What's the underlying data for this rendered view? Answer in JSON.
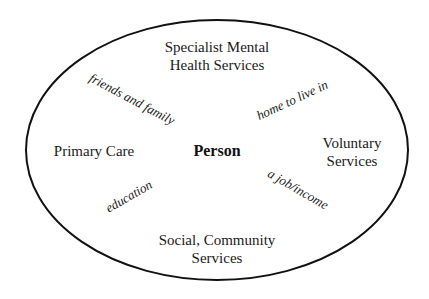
{
  "diagram": {
    "center": {
      "label": "Person"
    },
    "boundary": {
      "shape": "ellipse",
      "stroke_color": "#111111"
    },
    "services": [
      {
        "id": "specialist",
        "position": "top",
        "lines": [
          "Specialist Mental",
          "Health Services"
        ]
      },
      {
        "id": "primary",
        "position": "left",
        "lines": [
          "Primary Care"
        ]
      },
      {
        "id": "voluntary",
        "position": "right",
        "lines": [
          "Voluntary",
          "Services"
        ]
      },
      {
        "id": "social",
        "position": "bottom",
        "lines": [
          "Social, Community",
          "Services"
        ]
      }
    ],
    "needs": [
      {
        "id": "friends",
        "position": "upper-left",
        "label": "friends and family"
      },
      {
        "id": "home",
        "position": "upper-right",
        "label": "home to live in"
      },
      {
        "id": "education",
        "position": "lower-left",
        "label": "education"
      },
      {
        "id": "job",
        "position": "lower-right",
        "label": "a job/income"
      }
    ]
  }
}
